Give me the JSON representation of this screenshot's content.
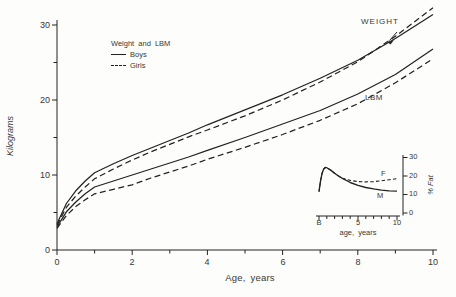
{
  "figure": {
    "background": "#fdfdfc",
    "line_color": "#232323",
    "text_color": "#383838"
  },
  "chart_data": [
    {
      "type": "line",
      "title": "",
      "xlabel": "Age, years",
      "ylabel": "Kilograms",
      "xlim": [
        0,
        10
      ],
      "ylim": [
        0,
        30
      ],
      "grid": false,
      "xticks_major": [
        0,
        2,
        4,
        6,
        8,
        10
      ],
      "xticks_minor": [
        1,
        3,
        5,
        7,
        9
      ],
      "yticks_major": [
        0,
        10,
        20,
        30
      ],
      "yticks_minor": [
        5,
        15,
        25
      ],
      "xtick_labels": [
        "0",
        "2",
        "4",
        "6",
        "8",
        "10"
      ],
      "ytick_labels": [
        "30",
        "20",
        "10",
        "0"
      ],
      "legend": {
        "title": "Weight and LBM",
        "position": "upper-left",
        "entries": [
          {
            "label": "Boys",
            "style": "solid"
          },
          {
            "label": "Girls",
            "style": "dashed"
          }
        ]
      },
      "annotations": [
        {
          "text": "WEIGHT",
          "x": 8.2,
          "y": 30.5
        },
        {
          "text": "LBM",
          "x": 8.3,
          "y": 20.3
        }
      ],
      "x": [
        0,
        0.25,
        0.5,
        0.75,
        1,
        1.5,
        2,
        2.5,
        3,
        3.5,
        4,
        5,
        6,
        7,
        8,
        9,
        10
      ],
      "series": [
        {
          "name": "Weight Boys",
          "style": "solid",
          "values": [
            3.5,
            6.2,
            7.9,
            9.2,
            10.3,
            11.5,
            12.6,
            13.6,
            14.6,
            15.6,
            16.7,
            18.7,
            20.7,
            22.9,
            25.3,
            28.2,
            31.4
          ]
        },
        {
          "name": "Weight Girls",
          "style": "dashed",
          "values": [
            3.3,
            5.7,
            7.2,
            8.4,
            9.5,
            10.8,
            12.0,
            13.1,
            14.1,
            15.1,
            16.0,
            17.9,
            20.0,
            22.4,
            25.1,
            28.5,
            32.3
          ]
        },
        {
          "name": "LBM Boys",
          "style": "solid",
          "values": [
            3.1,
            5.1,
            6.4,
            7.5,
            8.4,
            9.2,
            10.0,
            10.8,
            11.6,
            12.4,
            13.3,
            15.0,
            16.8,
            18.6,
            20.8,
            23.4,
            26.8
          ]
        },
        {
          "name": "LBM Girls",
          "style": "dashed",
          "values": [
            2.9,
            4.6,
            5.8,
            6.7,
            7.5,
            8.1,
            8.7,
            9.6,
            10.4,
            11.2,
            12.1,
            13.7,
            15.4,
            17.3,
            19.5,
            22.3,
            25.5
          ]
        }
      ]
    },
    {
      "type": "line",
      "title": "",
      "xlabel": "age, years",
      "ylabel": "% Fat",
      "xlim": [
        0,
        10
      ],
      "ylim": [
        0,
        30
      ],
      "grid": false,
      "xticks_major": [
        0,
        5,
        10
      ],
      "xticks_minor": [
        1,
        2,
        3,
        4,
        6,
        7,
        8,
        9
      ],
      "yticks_major": [
        0,
        10,
        20,
        30
      ],
      "xtick_labels": [
        "B",
        "5",
        "10"
      ],
      "ytick_labels": [
        "30",
        "20",
        "10",
        "0"
      ],
      "annotations": [
        {
          "text": "F",
          "x": 8.0,
          "y": 21
        },
        {
          "text": "M",
          "x": 7.6,
          "y": 9.5
        }
      ],
      "x": [
        0,
        0.2,
        0.4,
        0.6,
        0.8,
        1,
        1.5,
        2,
        2.5,
        3,
        4,
        5,
        6,
        7,
        8,
        9,
        10
      ],
      "series": [
        {
          "name": "M",
          "style": "solid",
          "values": [
            11.5,
            17.5,
            21.5,
            23.8,
            24.6,
            24.5,
            23.2,
            21.5,
            20.0,
            18.7,
            16.5,
            15.0,
            13.8,
            13.0,
            12.4,
            12.0,
            11.8
          ]
        },
        {
          "name": "F",
          "style": "dashed",
          "values": [
            11.5,
            17.5,
            21.5,
            23.8,
            24.6,
            24.5,
            23.2,
            21.5,
            20.0,
            18.8,
            17.6,
            17.0,
            16.8,
            17.0,
            17.4,
            18.0,
            18.6
          ]
        }
      ]
    }
  ]
}
